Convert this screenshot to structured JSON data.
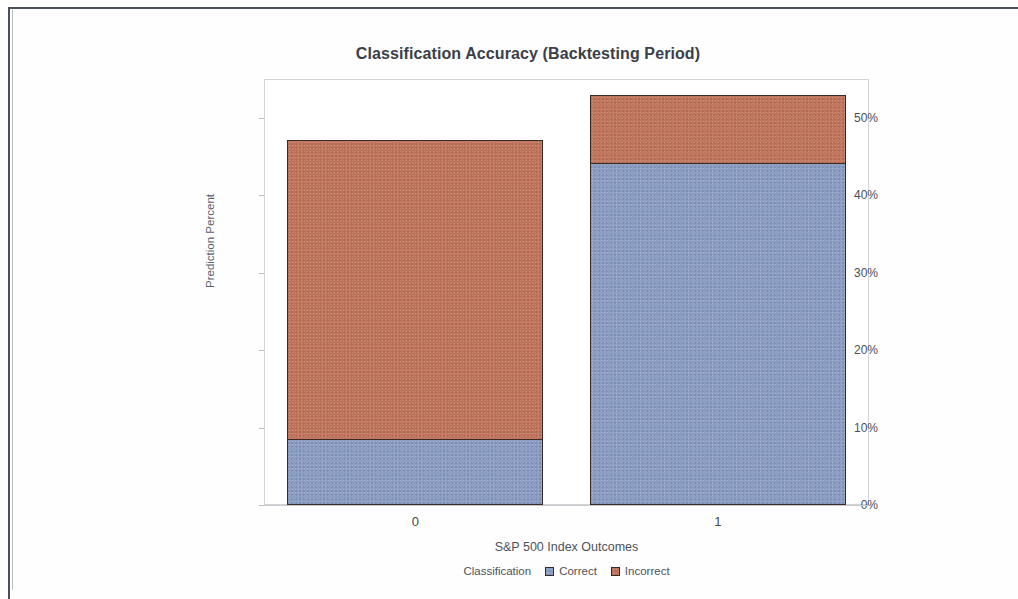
{
  "chart_data": {
    "type": "bar",
    "subtype": "stacked-bar-percent",
    "title": "Classification Accuracy (Backtesting Period)",
    "xlabel": "S&P 500 Index Outcomes",
    "ylabel": "Prediction Percent",
    "categories": [
      "0",
      "1"
    ],
    "series": [
      {
        "name": "Correct",
        "color": "#8c9ec4",
        "values": [
          8.4,
          44.0
        ]
      },
      {
        "name": "Incorrect",
        "color": "#c0765f",
        "values": [
          38.6,
          8.8
        ]
      }
    ],
    "stack_totals": [
      47.0,
      52.8
    ],
    "ylim": [
      0,
      55
    ],
    "ytick_values": [
      0,
      10,
      20,
      30,
      40,
      50
    ],
    "ytick_labels": [
      "0%",
      "10%",
      "20%",
      "30%",
      "40%",
      "50%"
    ],
    "grid": false,
    "legend_position": "bottom",
    "legend_title": "Classification"
  },
  "legend": {
    "title": "Classification",
    "entries": [
      {
        "label": "Correct"
      },
      {
        "label": "Incorrect"
      }
    ]
  }
}
